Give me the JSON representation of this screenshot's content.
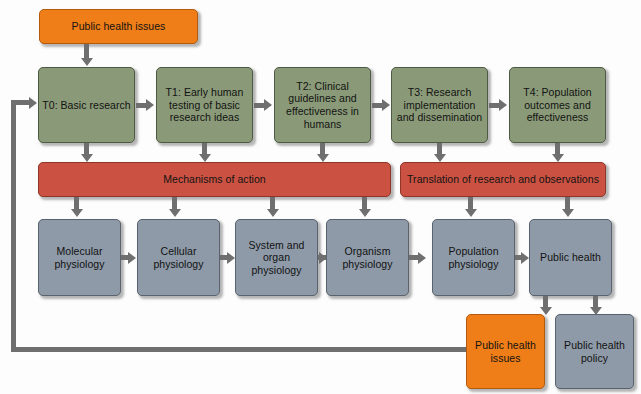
{
  "diagram": {
    "colors": {
      "green": "#8a9a78",
      "red": "#cb5242",
      "orange": "#f07e18",
      "blue_gray": "#8e9aa8",
      "connector": "#6f6f6f",
      "background": "#fdfdfd"
    },
    "top_input": {
      "label": "Public health issues"
    },
    "phases": [
      {
        "id": "T0",
        "label": "T0: Basic research"
      },
      {
        "id": "T1",
        "label": "T1: Early human testing of basic research ideas"
      },
      {
        "id": "T2",
        "label": "T2: Clinical guidelines and effectiveness in humans"
      },
      {
        "id": "T3",
        "label": "T3: Research implementation and dissemination"
      },
      {
        "id": "T4",
        "label": "T4: Population outcomes and effectiveness"
      }
    ],
    "bands": [
      {
        "id": "mechanisms",
        "label": "Mechanisms of action"
      },
      {
        "id": "translation",
        "label": "Translation of research and observations"
      }
    ],
    "levels": [
      {
        "id": "molecular",
        "label": "Molecular physiology"
      },
      {
        "id": "cellular",
        "label": "Cellular physiology"
      },
      {
        "id": "system-organ",
        "label": "System and organ physiology"
      },
      {
        "id": "organism",
        "label": "Organism physiology"
      },
      {
        "id": "population",
        "label": "Population physiology"
      },
      {
        "id": "public-health",
        "label": "Public health"
      }
    ],
    "outcomes": [
      {
        "id": "public-health-issues",
        "label": "Public health issues",
        "color": "orange"
      },
      {
        "id": "public-health-policy",
        "label": "Public health policy",
        "color": "blue"
      }
    ],
    "feedback_loop": {
      "description": "Public health issues feeds back to T0: Basic research"
    }
  }
}
